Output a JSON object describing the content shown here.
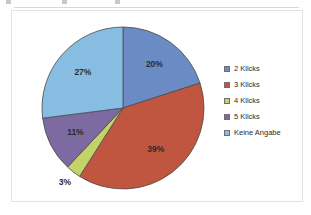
{
  "chart_data": {
    "type": "pie",
    "title": "",
    "subtitle": "",
    "xlabel": "",
    "ylabel": "",
    "legend_position": "right",
    "grid": false,
    "start_angle_deg": 0,
    "direction": "clockwise",
    "categories": [
      "2 Klicks",
      "3 Klicks",
      "4 Klicks",
      "5 Klicks",
      "Keine Angabe"
    ],
    "values": [
      20,
      39,
      3,
      11,
      27
    ],
    "value_unit": "%",
    "colors": [
      "#6a8bc4",
      "#c0563f",
      "#c3d36a",
      "#7c6aa0",
      "#86bde0"
    ],
    "slices": [
      {
        "label": "2 Klicks",
        "value": 20,
        "data_label": "20%",
        "color": "#6a8bc4",
        "label_inside": true
      },
      {
        "label": "3 Klicks",
        "value": 39,
        "data_label": "39%",
        "color": "#c0563f",
        "label_inside": true
      },
      {
        "label": "4 Klicks",
        "value": 3,
        "data_label": "3%",
        "color": "#c3d36a",
        "label_inside": false
      },
      {
        "label": "5 Klicks",
        "value": 11,
        "data_label": "11%",
        "color": "#7c6aa0",
        "label_inside": true
      },
      {
        "label": "Keine Angabe",
        "value": 27,
        "data_label": "27%",
        "color": "#86bde0",
        "label_inside": true
      }
    ]
  },
  "legend": {
    "items": [
      {
        "label": "2 Klicks",
        "color": "#6a8bc4"
      },
      {
        "label": "3 Klicks",
        "color": "#c0563f"
      },
      {
        "label": "4 Klicks",
        "color": "#c3d36a"
      },
      {
        "label": "5 Klicks",
        "color": "#7c6aa0"
      },
      {
        "label": "Keine Angabe",
        "color": "#86bde0"
      }
    ]
  },
  "frame": {
    "border_color": "#e2e2e2",
    "background": "#ffffff"
  }
}
